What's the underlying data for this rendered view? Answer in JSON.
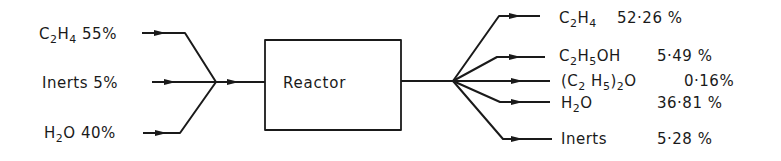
{
  "diagram": {
    "type": "process-flow",
    "unit": {
      "label": "Reactor"
    },
    "inputs": [
      {
        "species_html": "C<sub>2</sub>H<sub>4</sub>",
        "species": "C2H4",
        "percent": "55%"
      },
      {
        "species_html": "Inerts",
        "species": "Inerts",
        "percent": "5%"
      },
      {
        "species_html": "H<sub>2</sub>O",
        "species": "H2O",
        "percent": "40%"
      }
    ],
    "outputs": [
      {
        "species_html": "C<sub>2</sub>H<sub>4</sub>",
        "species": "C2H4",
        "percent": "52·26 %"
      },
      {
        "species_html": "C<sub>2</sub>H<sub>5</sub>OH",
        "species": "C2H5OH",
        "percent": "5·49 %"
      },
      {
        "species_html": "(C<sub>2</sub> H<sub>5</sub>)<sub>2</sub>O",
        "species": "(C2H5)2O",
        "percent": "0·16%"
      },
      {
        "species_html": "H<sub>2</sub>O",
        "species": "H2O",
        "percent": "36·81 %"
      },
      {
        "species_html": "Inerts",
        "species": "Inerts",
        "percent": "5·28 %"
      }
    ],
    "colors": {
      "line": "#1a1a1a",
      "background": "#ffffff"
    }
  }
}
